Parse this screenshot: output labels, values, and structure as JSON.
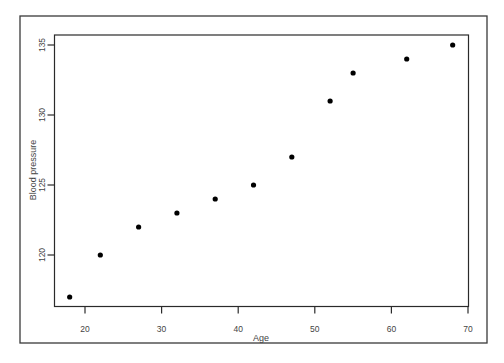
{
  "chart_data": {
    "type": "scatter",
    "title": "",
    "xlabel": "Age",
    "ylabel": "Blood pressure",
    "x": [
      18,
      22,
      27,
      32,
      37,
      42,
      47,
      52,
      55,
      62,
      68
    ],
    "y": [
      117,
      120,
      122,
      123,
      124,
      125,
      127,
      131,
      133,
      134,
      135
    ],
    "xticks": [
      20,
      30,
      40,
      50,
      60,
      70
    ],
    "yticks": [
      120,
      125,
      130,
      135
    ],
    "xlim": [
      16,
      70
    ],
    "ylim": [
      116,
      135.7
    ],
    "grid": false,
    "legend": null,
    "marker_color": "#000000"
  }
}
